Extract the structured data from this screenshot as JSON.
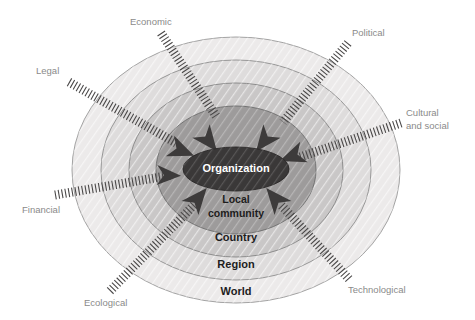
{
  "diagram": {
    "type": "concentric-layers",
    "center": {
      "x": 236,
      "y": 170
    },
    "rings": [
      {
        "id": "world",
        "label": "World",
        "rx": 164,
        "ry": 133,
        "fill": "#eceaea",
        "stroke": "#9a9a9a",
        "label_x": 236,
        "label_y": 292,
        "font_size": 11,
        "text_color": "#1d1d1d"
      },
      {
        "id": "region",
        "label": "Region",
        "rx": 135,
        "ry": 110,
        "fill": "#dedcdc",
        "stroke": "#8f8f8f",
        "label_x": 236,
        "label_y": 265,
        "font_size": 11,
        "text_color": "#1d1d1d"
      },
      {
        "id": "country",
        "label": "Country",
        "rx": 107,
        "ry": 87,
        "fill": "#c9c7c7",
        "stroke": "#858585",
        "label_x": 236,
        "label_y": 238,
        "font_size": 11,
        "text_color": "#1d1d1d"
      },
      {
        "id": "local-community",
        "label": "Local community",
        "label_line_1": "Local",
        "label_line_2": "community",
        "rx": 80,
        "ry": 64,
        "fill": "#9d9b9b",
        "stroke": "#6d6d6d",
        "label_x": 236,
        "label_y": 206,
        "font_size": 10.5,
        "text_color": "#1d1d1d"
      },
      {
        "id": "organization",
        "label": "Organization",
        "rx": 53,
        "ry": 22,
        "fill": "#3a3838",
        "stroke": "#2a2828",
        "label_x": 236,
        "label_y": 169,
        "font_size": 11,
        "text_color": "#ffffff"
      }
    ],
    "factors": [
      {
        "id": "economic",
        "label": "Economic",
        "label_x": 130,
        "label_y": 22,
        "anchor": "start",
        "line_x1": 161,
        "line_y1": 33,
        "line_x2": 216,
        "line_y2": 116
      },
      {
        "id": "political",
        "label": "Political",
        "label_x": 352,
        "label_y": 33,
        "anchor": "start",
        "line_x1": 348,
        "line_y1": 43,
        "line_x2": 283,
        "line_y2": 122
      },
      {
        "id": "legal",
        "label": "Legal",
        "label_x": 36,
        "label_y": 71,
        "anchor": "start",
        "line_x1": 69,
        "line_y1": 82,
        "line_x2": 176,
        "line_y2": 143
      },
      {
        "id": "cultural-and-social",
        "label": "Cultural and social",
        "label_line_1": "Cultural",
        "label_line_2": "and social",
        "label_x": 406,
        "label_y": 113,
        "anchor": "start",
        "line_x1": 401,
        "line_y1": 123,
        "line_x2": 300,
        "line_y2": 157
      },
      {
        "id": "financial",
        "label": "Financial",
        "label_x": 22,
        "label_y": 210,
        "anchor": "start",
        "line_x1": 55,
        "line_y1": 195,
        "line_x2": 172,
        "line_y2": 175
      },
      {
        "id": "ecological",
        "label": "Ecological",
        "label_x": 84,
        "label_y": 303,
        "anchor": "start",
        "line_x1": 110,
        "line_y1": 291,
        "line_x2": 197,
        "line_y2": 202
      },
      {
        "id": "technological",
        "label": "Technological",
        "label_x": 348,
        "label_y": 290,
        "anchor": "start",
        "line_x1": 349,
        "line_y1": 279,
        "line_x2": 281,
        "line_y2": 205
      }
    ],
    "arrows": [
      {
        "id": "arrow-top-left",
        "x": 198,
        "y": 130,
        "rotation": 52
      },
      {
        "id": "arrow-top-right",
        "x": 275,
        "y": 130,
        "rotation": 128
      },
      {
        "id": "arrow-left-upper",
        "x": 172,
        "y": 148,
        "rotation": 20
      },
      {
        "id": "arrow-right-upper",
        "x": 302,
        "y": 152,
        "rotation": 160
      },
      {
        "id": "arrow-left-lower",
        "x": 160,
        "y": 172,
        "rotation": 0
      },
      {
        "id": "arrow-bottom-left",
        "x": 192,
        "y": 203,
        "rotation": -48
      },
      {
        "id": "arrow-bottom-right",
        "x": 282,
        "y": 203,
        "rotation": 228
      }
    ],
    "colors": {
      "background": "#ffffff",
      "factor_text": "#8a8a8a",
      "ring_text": "#1d1d1d",
      "core_text": "#ffffff",
      "arrow_fill": "#3d3b3b",
      "hatch_line": "#4a4848"
    }
  }
}
